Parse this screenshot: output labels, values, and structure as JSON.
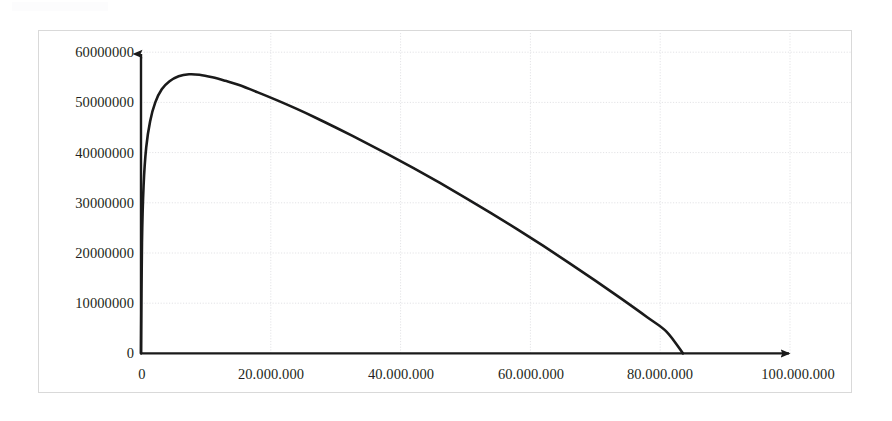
{
  "chart_data": {
    "type": "line",
    "title": "",
    "subtitle": "",
    "xlabel": "",
    "ylabel": "",
    "xlim": [
      0,
      100000000
    ],
    "ylim": [
      0,
      60000000
    ],
    "grid": true,
    "legend": false,
    "legend_position": "none",
    "x_tick_labels": [
      "0",
      "20.000.000",
      "40.000.000",
      "60.000.000",
      "80.000.000",
      "100.000.000"
    ],
    "x_ticks": [
      0,
      20000000,
      40000000,
      60000000,
      80000000,
      100000000
    ],
    "y_tick_labels": [
      "0",
      "10000000",
      "20000000",
      "30000000",
      "40000000",
      "50000000",
      "60000000"
    ],
    "y_ticks": [
      0,
      10000000,
      20000000,
      30000000,
      40000000,
      50000000,
      60000000
    ],
    "axis_arrows": {
      "x": "right-arrow",
      "y": "up-arrow"
    },
    "series": [
      {
        "name": "curve",
        "color": "#1a1a1a",
        "line_width": 2.6,
        "x": [
          0,
          150000,
          400000,
          800000,
          1400000,
          2200000,
          3200000,
          4400000,
          5800000,
          7400000,
          9000000,
          11000000,
          13000000,
          15000000,
          18000000,
          21000000,
          24000000,
          27000000,
          30000000,
          34000000,
          38000000,
          42000000,
          46000000,
          50000000,
          54000000,
          58000000,
          62000000,
          66000000,
          70000000,
          74000000,
          78000000,
          81000000,
          83500000
        ],
        "y": [
          0,
          22000000,
          33500000,
          41000000,
          46200000,
          50000000,
          52600000,
          54200000,
          55200000,
          55600000,
          55500000,
          55000000,
          54300000,
          53500000,
          52000000,
          50400000,
          48700000,
          46900000,
          45000000,
          42400000,
          39700000,
          36900000,
          34000000,
          31000000,
          27900000,
          24700000,
          21400000,
          18000000,
          14500000,
          10900000,
          7200000,
          4300000,
          0
        ]
      }
    ],
    "peak": {
      "x": 8000000,
      "y": 55600000
    },
    "zero_crossing": {
      "x": 83500000,
      "y": 0
    }
  },
  "axes": {
    "y_labels": [
      "60000000",
      "50000000",
      "40000000",
      "30000000",
      "20000000",
      "10000000",
      "0"
    ],
    "x_labels": [
      "0",
      "20.000.000",
      "40.000.000",
      "60.000.000",
      "80.000.000",
      "100.000.000"
    ]
  },
  "colors": {
    "curve": "#1a1a1a",
    "axis": "#1a1a1a",
    "grid": "#e3e3e6",
    "frame": "#d9d9d9",
    "text": "#231f20",
    "background": "#ffffff"
  }
}
